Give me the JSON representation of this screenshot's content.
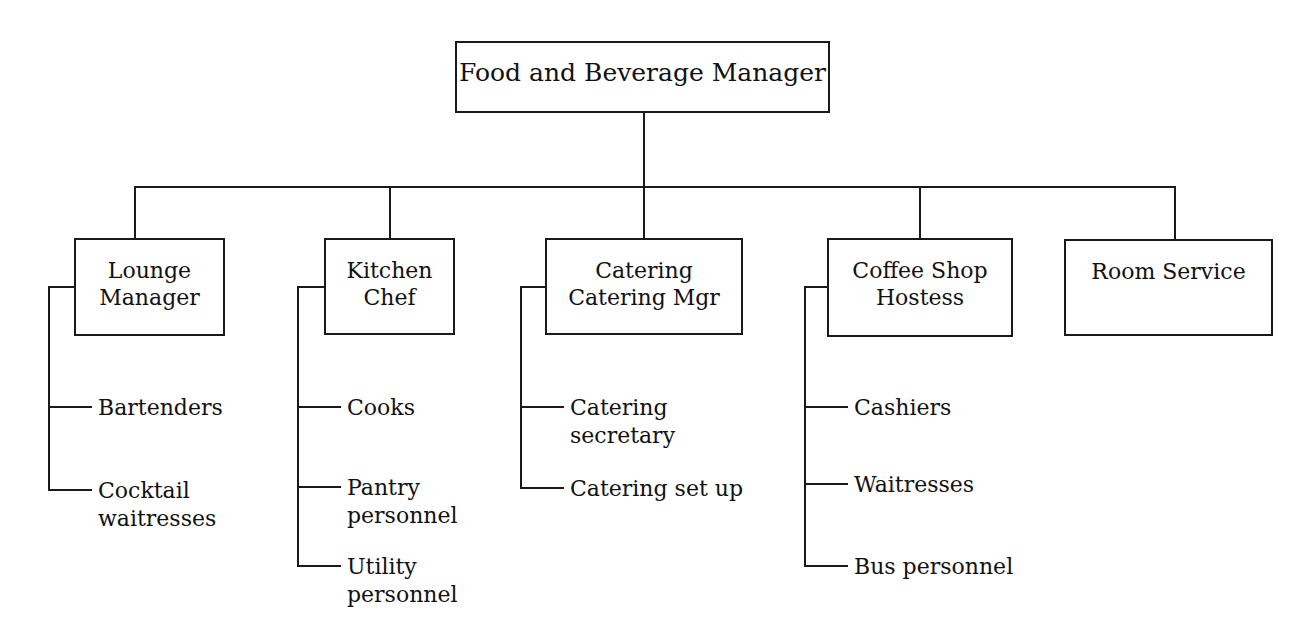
{
  "chart": {
    "type": "organization-chart",
    "title": "Food and Beverage Manager",
    "root": {
      "label": "Food and Beverage Manager"
    },
    "departments": [
      {
        "label": "Lounge\nManager",
        "line1": "Lounge",
        "line2": "Manager",
        "reports": [
          {
            "label": "Bartenders"
          },
          {
            "label": "Cocktail\nwaitresses"
          }
        ]
      },
      {
        "label": "Kitchen\nChef",
        "line1": "Kitchen",
        "line2": "Chef",
        "reports": [
          {
            "label": "Cooks"
          },
          {
            "label": "Pantry\npersonnel"
          },
          {
            "label": "Utility\npersonnel"
          }
        ]
      },
      {
        "label": "Catering\nCatering Mgr",
        "line1": "Catering",
        "line2": "Catering Mgr",
        "reports": [
          {
            "label": "Catering\nsecretary"
          },
          {
            "label": "Catering set up"
          }
        ]
      },
      {
        "label": "Coffee Shop\nHostess",
        "line1": "Coffee Shop",
        "line2": "Hostess",
        "reports": [
          {
            "label": "Cashiers"
          },
          {
            "label": "Waitresses"
          },
          {
            "label": "Bus personnel"
          }
        ]
      },
      {
        "label": "Room Service",
        "line1": "Room Service",
        "line2": "",
        "reports": []
      }
    ],
    "colors": {
      "line": "#1a1a1a",
      "text": "#111111",
      "background": "#ffffff"
    }
  }
}
